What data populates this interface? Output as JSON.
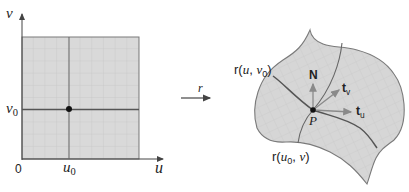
{
  "figure": {
    "domain_plot": {
      "axis_v_label": "v",
      "axis_u_label": "u",
      "origin_label": "0",
      "v0_label": "v",
      "v0_sub": "0",
      "u0_label": "u",
      "u0_sub": "0"
    },
    "mapping": {
      "label": "r"
    },
    "surface": {
      "curve_u_label_prefix": "r(",
      "curve_u_var": "u",
      "curve_u_sep": ", ",
      "curve_u_fixed": "v",
      "curve_u_fixed_sub": "0",
      "curve_u_suffix": ")",
      "curve_v_label_prefix": "r(",
      "curve_v_fixed": "u",
      "curve_v_fixed_sub": "0",
      "curve_v_sep": ", ",
      "curve_v_var": "v",
      "curve_v_suffix": ")",
      "normal_label": "N",
      "tangent_v_label": "t",
      "tangent_v_sub": "v",
      "tangent_u_label": "t",
      "tangent_u_sub": "u",
      "point_label": "P"
    },
    "colors": {
      "fill": "#d9d9d9",
      "grid": "#bdbdbd",
      "stroke": "#6e6e6e",
      "curve": "#555555",
      "point": "#111111",
      "vector": "#8a8a8a"
    }
  }
}
